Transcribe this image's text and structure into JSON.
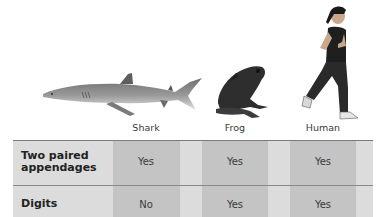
{
  "animals": [
    {
      "name": "Shark",
      "icon": "shark-icon"
    },
    {
      "name": "Frog",
      "icon": "frog-icon"
    },
    {
      "name": "Human",
      "icon": "human-runner-icon"
    }
  ],
  "table": {
    "rows": [
      {
        "label": "Two paired appendages",
        "label_line1": "Two paired",
        "label_line2": "appendages",
        "values": [
          "Yes",
          "Yes",
          "Yes"
        ]
      },
      {
        "label": "Digits",
        "values": [
          "No",
          "Yes",
          "Yes"
        ]
      }
    ]
  },
  "colors": {
    "column_dark": "#c4c4c4",
    "column_light": "#dcdcdc",
    "divider": "#8a8a8a"
  }
}
